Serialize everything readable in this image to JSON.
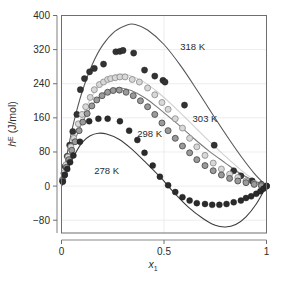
{
  "chart_data": {
    "type": "scatter",
    "title": "",
    "subtitle": "",
    "xlabel": "x",
    "xlabel_sub": "1",
    "ylabel": "h",
    "ylabel_sup": "E",
    "ylabel_unit": " (J/mol)",
    "xlim": [
      0,
      1
    ],
    "ylim": [
      -110,
      400
    ],
    "grid": true,
    "legend_position": "inline-annotations",
    "xticks": [
      0,
      0.5,
      1
    ],
    "xtick_labels": [
      "0",
      "0.5",
      "1"
    ],
    "yticks": [
      -80,
      0,
      80,
      160,
      240,
      320,
      400
    ],
    "ytick_labels": [
      "-80",
      "0",
      "80",
      "160",
      "240",
      "320",
      "400"
    ],
    "annotations": [
      {
        "text": "318 K",
        "x": 0.64,
        "y": 318
      },
      {
        "text": "303 K",
        "x": 0.7,
        "y": 150
      },
      {
        "text": "298 K",
        "x": 0.43,
        "y": 116
      },
      {
        "text": "278 K",
        "x": 0.22,
        "y": 28
      }
    ],
    "series": [
      {
        "name": "318 K",
        "marker": "filled-circle",
        "marker_color": "#333333",
        "marker_edge": "#1a1a1a",
        "marker_size": 3.1,
        "line_color": "#555555",
        "points": [
          {
            "x": 0.005,
            "y": 14
          },
          {
            "x": 0.012,
            "y": 30
          },
          {
            "x": 0.018,
            "y": 46
          },
          {
            "x": 0.028,
            "y": 70
          },
          {
            "x": 0.04,
            "y": 96
          },
          {
            "x": 0.055,
            "y": 128
          },
          {
            "x": 0.075,
            "y": 168
          },
          {
            "x": 0.092,
            "y": 226
          },
          {
            "x": 0.112,
            "y": 252
          },
          {
            "x": 0.137,
            "y": 268
          },
          {
            "x": 0.16,
            "y": 276
          },
          {
            "x": 0.205,
            "y": 286
          },
          {
            "x": 0.265,
            "y": 315
          },
          {
            "x": 0.285,
            "y": 316
          },
          {
            "x": 0.3,
            "y": 318
          },
          {
            "x": 0.352,
            "y": 312
          },
          {
            "x": 0.405,
            "y": 272
          },
          {
            "x": 0.455,
            "y": 258
          },
          {
            "x": 0.495,
            "y": 248
          },
          {
            "x": 0.505,
            "y": 244
          },
          {
            "x": 0.6,
            "y": 190
          },
          {
            "x": 0.745,
            "y": 96
          },
          {
            "x": 0.84,
            "y": 36
          },
          {
            "x": 0.875,
            "y": 24
          },
          {
            "x": 0.93,
            "y": 12
          },
          {
            "x": 0.975,
            "y": 4
          },
          {
            "x": 1.0,
            "y": 0
          }
        ],
        "curve": [
          {
            "x": 0.0,
            "y": 0
          },
          {
            "x": 0.03,
            "y": 82
          },
          {
            "x": 0.06,
            "y": 150
          },
          {
            "x": 0.1,
            "y": 220
          },
          {
            "x": 0.15,
            "y": 285
          },
          {
            "x": 0.2,
            "y": 330
          },
          {
            "x": 0.26,
            "y": 363
          },
          {
            "x": 0.32,
            "y": 378
          },
          {
            "x": 0.36,
            "y": 379
          },
          {
            "x": 0.42,
            "y": 366
          },
          {
            "x": 0.5,
            "y": 332
          },
          {
            "x": 0.58,
            "y": 283
          },
          {
            "x": 0.66,
            "y": 226
          },
          {
            "x": 0.74,
            "y": 166
          },
          {
            "x": 0.82,
            "y": 108
          },
          {
            "x": 0.88,
            "y": 67
          },
          {
            "x": 0.94,
            "y": 30
          },
          {
            "x": 1.0,
            "y": 0
          }
        ]
      },
      {
        "name": "303 K",
        "marker": "open-circle",
        "marker_color": "#d8d8d8",
        "marker_edge": "#8c8c8c",
        "marker_size": 3.0,
        "line_color": "#cfcfcf",
        "points": [
          {
            "x": 0.006,
            "y": 16
          },
          {
            "x": 0.014,
            "y": 32
          },
          {
            "x": 0.022,
            "y": 50
          },
          {
            "x": 0.032,
            "y": 68
          },
          {
            "x": 0.046,
            "y": 92
          },
          {
            "x": 0.06,
            "y": 112
          },
          {
            "x": 0.082,
            "y": 146
          },
          {
            "x": 0.1,
            "y": 168
          },
          {
            "x": 0.118,
            "y": 186
          },
          {
            "x": 0.14,
            "y": 208
          },
          {
            "x": 0.16,
            "y": 226
          },
          {
            "x": 0.185,
            "y": 238
          },
          {
            "x": 0.205,
            "y": 244
          },
          {
            "x": 0.225,
            "y": 250
          },
          {
            "x": 0.24,
            "y": 252
          },
          {
            "x": 0.262,
            "y": 254
          },
          {
            "x": 0.285,
            "y": 256
          },
          {
            "x": 0.31,
            "y": 256
          },
          {
            "x": 0.345,
            "y": 250
          },
          {
            "x": 0.38,
            "y": 244
          },
          {
            "x": 0.42,
            "y": 230
          },
          {
            "x": 0.455,
            "y": 214
          },
          {
            "x": 0.49,
            "y": 196
          },
          {
            "x": 0.52,
            "y": 180
          },
          {
            "x": 0.555,
            "y": 158
          },
          {
            "x": 0.59,
            "y": 136
          },
          {
            "x": 0.625,
            "y": 112
          },
          {
            "x": 0.66,
            "y": 92
          },
          {
            "x": 0.7,
            "y": 72
          },
          {
            "x": 0.74,
            "y": 54
          },
          {
            "x": 0.78,
            "y": 40
          },
          {
            "x": 0.82,
            "y": 28
          },
          {
            "x": 0.86,
            "y": 20
          },
          {
            "x": 0.9,
            "y": 12
          },
          {
            "x": 0.94,
            "y": 6
          },
          {
            "x": 0.975,
            "y": 2
          },
          {
            "x": 1.0,
            "y": 0
          }
        ],
        "curve": [
          {
            "x": 0.0,
            "y": 0
          },
          {
            "x": 0.03,
            "y": 60
          },
          {
            "x": 0.06,
            "y": 110
          },
          {
            "x": 0.1,
            "y": 164
          },
          {
            "x": 0.15,
            "y": 212
          },
          {
            "x": 0.2,
            "y": 243
          },
          {
            "x": 0.25,
            "y": 259
          },
          {
            "x": 0.29,
            "y": 263
          },
          {
            "x": 0.33,
            "y": 260
          },
          {
            "x": 0.4,
            "y": 245
          },
          {
            "x": 0.47,
            "y": 220
          },
          {
            "x": 0.55,
            "y": 186
          },
          {
            "x": 0.63,
            "y": 148
          },
          {
            "x": 0.71,
            "y": 110
          },
          {
            "x": 0.79,
            "y": 74
          },
          {
            "x": 0.86,
            "y": 44
          },
          {
            "x": 0.93,
            "y": 18
          },
          {
            "x": 1.0,
            "y": 0
          }
        ]
      },
      {
        "name": "298 K",
        "marker": "gray-circle",
        "marker_color": "#9a9a9a",
        "marker_edge": "#4a4a4a",
        "marker_size": 3.0,
        "line_color": "#7a7a7a",
        "points": [
          {
            "x": 0.006,
            "y": 12
          },
          {
            "x": 0.014,
            "y": 26
          },
          {
            "x": 0.024,
            "y": 44
          },
          {
            "x": 0.036,
            "y": 62
          },
          {
            "x": 0.05,
            "y": 84
          },
          {
            "x": 0.066,
            "y": 104
          },
          {
            "x": 0.086,
            "y": 130
          },
          {
            "x": 0.104,
            "y": 150
          },
          {
            "x": 0.125,
            "y": 170
          },
          {
            "x": 0.148,
            "y": 188
          },
          {
            "x": 0.172,
            "y": 202
          },
          {
            "x": 0.198,
            "y": 212
          },
          {
            "x": 0.225,
            "y": 220
          },
          {
            "x": 0.252,
            "y": 224
          },
          {
            "x": 0.282,
            "y": 225
          },
          {
            "x": 0.315,
            "y": 220
          },
          {
            "x": 0.35,
            "y": 212
          },
          {
            "x": 0.385,
            "y": 200
          },
          {
            "x": 0.42,
            "y": 186
          },
          {
            "x": 0.455,
            "y": 168
          },
          {
            "x": 0.49,
            "y": 148
          },
          {
            "x": 0.52,
            "y": 130
          },
          {
            "x": 0.555,
            "y": 112
          },
          {
            "x": 0.59,
            "y": 94
          },
          {
            "x": 0.625,
            "y": 78
          },
          {
            "x": 0.66,
            "y": 62
          },
          {
            "x": 0.7,
            "y": 48
          },
          {
            "x": 0.74,
            "y": 36
          },
          {
            "x": 0.78,
            "y": 26
          },
          {
            "x": 0.82,
            "y": 18
          },
          {
            "x": 0.86,
            "y": 12
          },
          {
            "x": 0.9,
            "y": 8
          },
          {
            "x": 0.94,
            "y": 4
          },
          {
            "x": 0.975,
            "y": 1
          },
          {
            "x": 1.0,
            "y": 0
          }
        ],
        "curve": [
          {
            "x": 0.0,
            "y": 0
          },
          {
            "x": 0.03,
            "y": 54
          },
          {
            "x": 0.06,
            "y": 100
          },
          {
            "x": 0.1,
            "y": 148
          },
          {
            "x": 0.15,
            "y": 190
          },
          {
            "x": 0.2,
            "y": 216
          },
          {
            "x": 0.25,
            "y": 228
          },
          {
            "x": 0.29,
            "y": 230
          },
          {
            "x": 0.34,
            "y": 224
          },
          {
            "x": 0.41,
            "y": 206
          },
          {
            "x": 0.48,
            "y": 180
          },
          {
            "x": 0.56,
            "y": 148
          },
          {
            "x": 0.64,
            "y": 114
          },
          {
            "x": 0.72,
            "y": 82
          },
          {
            "x": 0.8,
            "y": 54
          },
          {
            "x": 0.87,
            "y": 30
          },
          {
            "x": 0.94,
            "y": 12
          },
          {
            "x": 1.0,
            "y": 0
          }
        ]
      },
      {
        "name": "278 K",
        "marker": "filled-circle",
        "marker_color": "#2b2b2b",
        "marker_edge": "#1a1a1a",
        "marker_size": 3.0,
        "line_color": "#3a3a3a",
        "points": [
          {
            "x": 0.006,
            "y": 10
          },
          {
            "x": 0.016,
            "y": 26
          },
          {
            "x": 0.028,
            "y": 40
          },
          {
            "x": 0.042,
            "y": 56
          },
          {
            "x": 0.058,
            "y": 72
          },
          {
            "x": 0.09,
            "y": 104
          },
          {
            "x": 0.135,
            "y": 152
          },
          {
            "x": 0.18,
            "y": 158
          },
          {
            "x": 0.225,
            "y": 158
          },
          {
            "x": 0.285,
            "y": 152
          },
          {
            "x": 0.33,
            "y": 130
          },
          {
            "x": 0.37,
            "y": 108
          },
          {
            "x": 0.405,
            "y": 78
          },
          {
            "x": 0.445,
            "y": 48
          },
          {
            "x": 0.48,
            "y": 22
          },
          {
            "x": 0.52,
            "y": 2
          },
          {
            "x": 0.555,
            "y": -14
          },
          {
            "x": 0.59,
            "y": -26
          },
          {
            "x": 0.625,
            "y": -34
          },
          {
            "x": 0.66,
            "y": -40
          },
          {
            "x": 0.7,
            "y": -42
          },
          {
            "x": 0.735,
            "y": -44
          },
          {
            "x": 0.77,
            "y": -44
          },
          {
            "x": 0.805,
            "y": -42
          },
          {
            "x": 0.84,
            "y": -38
          },
          {
            "x": 0.875,
            "y": -34
          },
          {
            "x": 0.9,
            "y": -28
          },
          {
            "x": 0.925,
            "y": -24
          },
          {
            "x": 0.95,
            "y": -18
          },
          {
            "x": 0.97,
            "y": -12
          },
          {
            "x": 0.985,
            "y": -6
          },
          {
            "x": 1.0,
            "y": 0
          }
        ],
        "curve": [
          {
            "x": 0.0,
            "y": 0
          },
          {
            "x": 0.03,
            "y": 38
          },
          {
            "x": 0.06,
            "y": 70
          },
          {
            "x": 0.1,
            "y": 102
          },
          {
            "x": 0.14,
            "y": 118
          },
          {
            "x": 0.18,
            "y": 124
          },
          {
            "x": 0.22,
            "y": 122
          },
          {
            "x": 0.28,
            "y": 110
          },
          {
            "x": 0.34,
            "y": 88
          },
          {
            "x": 0.41,
            "y": 56
          },
          {
            "x": 0.48,
            "y": 22
          },
          {
            "x": 0.55,
            "y": -16
          },
          {
            "x": 0.62,
            "y": -50
          },
          {
            "x": 0.69,
            "y": -76
          },
          {
            "x": 0.75,
            "y": -92
          },
          {
            "x": 0.8,
            "y": -96
          },
          {
            "x": 0.85,
            "y": -90
          },
          {
            "x": 0.9,
            "y": -72
          },
          {
            "x": 0.95,
            "y": -42
          },
          {
            "x": 1.0,
            "y": 0
          }
        ]
      }
    ]
  }
}
